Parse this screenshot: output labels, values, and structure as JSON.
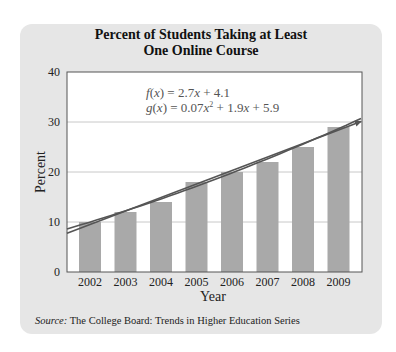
{
  "chart_data": {
    "type": "bar",
    "title": "Percent of Students Taking at Least One Online Course",
    "title_lines": [
      "Percent of Students Taking at Least",
      "One Online Course"
    ],
    "xlabel": "Year",
    "ylabel": "Percent",
    "categories": [
      "2002",
      "2003",
      "2004",
      "2005",
      "2006",
      "2007",
      "2008",
      "2009"
    ],
    "values": [
      10,
      12,
      14,
      18,
      20,
      22,
      25,
      29
    ],
    "ylim": [
      0,
      40
    ],
    "yticks": [
      0,
      10,
      20,
      30,
      40
    ],
    "grid": true,
    "annotations": [
      {
        "type": "line",
        "name": "f(x)",
        "equation": "f(x) = 2.7x + 4.1"
      },
      {
        "type": "curve",
        "name": "g(x)",
        "equation": "g(x) = 0.07x^2 + 1.9x + 5.9"
      }
    ],
    "source": "The College Board: Trends in Higher Education Series"
  },
  "labels": {
    "f_eq_prefix": "f(x) = 2.7",
    "f_eq_x": "x",
    "f_eq_suffix": " + 4.1",
    "g_eq_prefix": "g(x) = 0.07",
    "g_eq_x": "x",
    "g_eq_sup": "2",
    "g_eq_mid": " + 1.9",
    "g_eq_x2": "x",
    "g_eq_suffix": " + 5.9",
    "source_prefix": "Source:",
    "source_text": " The College Board: Trends in Higher Education Series"
  },
  "colors": {
    "panel": "#e6e6e6",
    "bar": "#a9a9a9",
    "grid": "#c8c8c8",
    "lines": "#555555",
    "axis": "#555555"
  }
}
